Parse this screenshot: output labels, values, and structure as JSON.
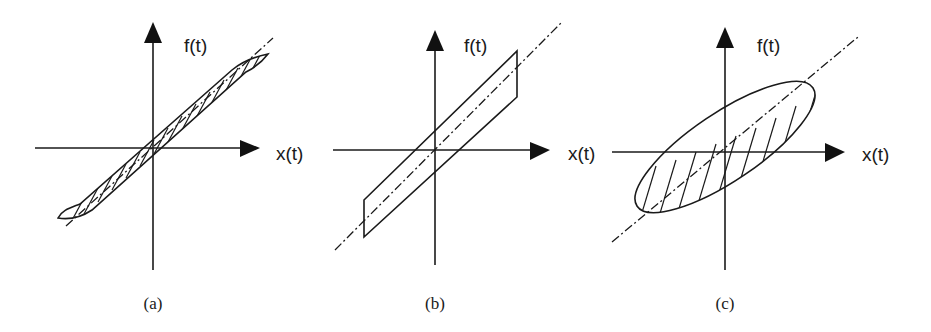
{
  "figure": {
    "panels": [
      {
        "id": "a",
        "caption": "(a)",
        "y_axis_label": "f(t)",
        "x_axis_label": "x(t)",
        "shape": "narrow hatched hysteresis loop along a dash-dot diagonal"
      },
      {
        "id": "b",
        "caption": "(b)",
        "y_axis_label": "f(t)",
        "x_axis_label": "x(t)",
        "shape": "unhatched parallelogram loop along a dash-dot diagonal"
      },
      {
        "id": "c",
        "caption": "(c)",
        "y_axis_label": "f(t)",
        "x_axis_label": "x(t)",
        "shape": "hatched elliptical loop along a dash-dot diagonal"
      }
    ],
    "colors": {
      "ink": "#1a1a1a",
      "background": "#ffffff"
    }
  }
}
